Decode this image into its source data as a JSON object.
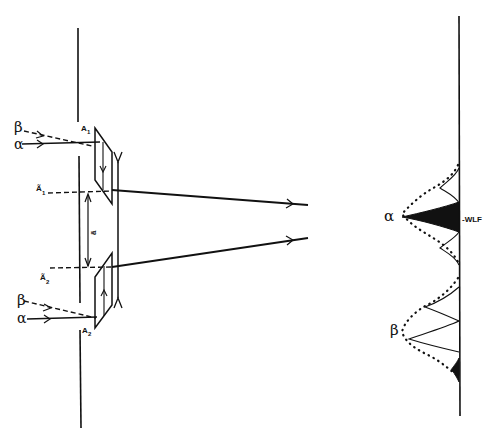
{
  "diagram": {
    "type": "optical-schematic",
    "background": "#ffffff",
    "ink": "#111111",
    "left_panel": {
      "labels": {
        "beta_top": "β",
        "alpha_top": "α",
        "A1": "A",
        "A1_sub": "1",
        "A1_tilde": "Ã",
        "A1_tilde_sub": "1",
        "a_tilde": "ã",
        "A2_tilde": "Ã",
        "A2_tilde_sub": "2",
        "beta_bottom": "β",
        "alpha_bottom": "α",
        "A2": "A",
        "A2_sub": "2"
      }
    },
    "right_panel": {
      "labels": {
        "alpha": "α",
        "beta": "β",
        "wlf": "-WLF"
      }
    }
  }
}
